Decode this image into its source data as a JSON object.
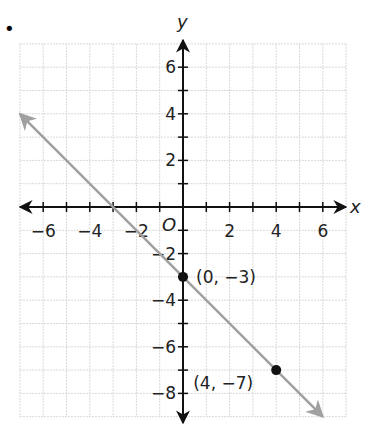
{
  "bullet": "•",
  "chart_data": {
    "type": "line",
    "title": "",
    "xlabel": "x",
    "ylabel": "y",
    "origin_label": "O",
    "xlim": [
      -7,
      7
    ],
    "ylim": [
      -9,
      7
    ],
    "grid": true,
    "x_ticks": [
      -6,
      -4,
      -2,
      2,
      4,
      6
    ],
    "x_tick_labels": [
      "−6",
      "−4",
      "−2",
      "2",
      "4",
      "6"
    ],
    "y_ticks": [
      6,
      4,
      2,
      -2,
      -4,
      -6,
      -8
    ],
    "y_tick_labels": [
      "6",
      "4",
      "2",
      "−2",
      "−4",
      "−6",
      "−8"
    ],
    "series": [
      {
        "name": "line",
        "equation": "y = -x - 3",
        "x": [
          -7,
          6
        ],
        "y": [
          4,
          -9
        ],
        "color": "#a0a0a0"
      }
    ],
    "points": [
      {
        "x": 0,
        "y": -3,
        "label": "(0, −3)"
      },
      {
        "x": 4,
        "y": -7,
        "label": "(4, −7)"
      }
    ]
  }
}
